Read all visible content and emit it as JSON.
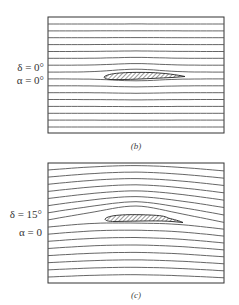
{
  "panels": [
    {
      "id": "b",
      "caption": "(b)",
      "labels": [
        "δ = 0°",
        "α = 0°"
      ],
      "flap_deflection_deg": 0,
      "angle_of_attack_deg": 0,
      "streamline_count": 16
    },
    {
      "id": "c",
      "caption": "(c)",
      "labels": [
        "δ = 15°",
        "α = 0"
      ],
      "flap_deflection_deg": 15,
      "angle_of_attack_deg": 0,
      "streamline_count": 16
    }
  ],
  "colors": {
    "line": "#555555",
    "frame": "#333333",
    "hatch": "#222222"
  }
}
